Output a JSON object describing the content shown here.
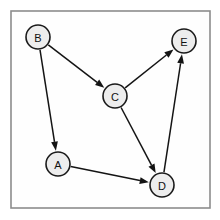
{
  "figure": {
    "kind": "directed-graph-diagram",
    "width": 220,
    "height": 220,
    "background_color": "#ffffff",
    "frame": {
      "x": 11,
      "y": 11,
      "width": 199,
      "height": 197,
      "fill_color": "#fefefe",
      "stroke_color": "#8c8c8c",
      "stroke_width": 1.6
    }
  },
  "style": {
    "node_fill": "#ededed",
    "node_stroke": "#1a1a1a",
    "node_stroke_width": 1.6,
    "node_radius": 12,
    "label_color": "#111111",
    "label_size": 11,
    "edge_color": "#141414",
    "edge_width": 1.5,
    "arrow_length": 9,
    "arrow_half_width": 3.4
  },
  "graph": {
    "directed": true,
    "node_count": 5,
    "edge_count": 5,
    "nodes": [
      {
        "id": "B",
        "label": "B",
        "cx": 38,
        "cy": 37,
        "r": 12
      },
      {
        "id": "C",
        "label": "C",
        "cx": 115,
        "cy": 96,
        "r": 12
      },
      {
        "id": "E",
        "label": "E",
        "cx": 184,
        "cy": 41,
        "r": 12
      },
      {
        "id": "A",
        "label": "A",
        "cx": 58,
        "cy": 164,
        "r": 12
      },
      {
        "id": "D",
        "label": "D",
        "cx": 162,
        "cy": 185,
        "r": 12
      }
    ],
    "edges": [
      {
        "id": "edge-b-c",
        "from": "B",
        "to": "C",
        "label": ""
      },
      {
        "id": "edge-b-a",
        "from": "B",
        "to": "A",
        "label": ""
      },
      {
        "id": "edge-c-e",
        "from": "C",
        "to": "E",
        "label": ""
      },
      {
        "id": "edge-c-d",
        "from": "C",
        "to": "D",
        "label": ""
      },
      {
        "id": "edge-a-d",
        "from": "A",
        "to": "D",
        "label": ""
      },
      {
        "id": "edge-d-e",
        "from": "D",
        "to": "E",
        "label": ""
      }
    ]
  }
}
